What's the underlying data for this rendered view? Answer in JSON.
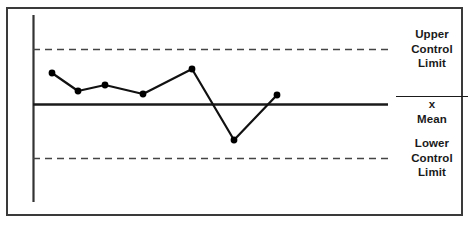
{
  "labels": {
    "ucl": {
      "line1": "Upper",
      "line2": "Control",
      "line3": "Limit"
    },
    "mean": {
      "symbol": "x",
      "text": " Mean"
    },
    "lcl": {
      "line1": "Lower",
      "line2": "Control",
      "line3": "Limit"
    }
  },
  "colors": {
    "frame": "#3a3a3a",
    "axis": "#333333",
    "mean_line": "#1a1a1a",
    "limit_line": "#444444",
    "series": "#111111",
    "marker": "#000000",
    "background": "#ffffff",
    "text": "#1a1a1a"
  },
  "chart_data": {
    "type": "line",
    "title": "",
    "subtitle": "",
    "xlabel": "",
    "ylabel": "",
    "grid": false,
    "legend_position": "right",
    "xlim": [
      0,
      8
    ],
    "ylim": [
      0,
      10
    ],
    "x": [
      1,
      2,
      3,
      4,
      5,
      6,
      7
    ],
    "series": [
      {
        "name": "Sample Measurement",
        "values": [
          6.7,
          5.4,
          5.9,
          5.2,
          7.4,
          2.2,
          5.1
        ],
        "marker": "circle"
      }
    ],
    "reference_lines": [
      {
        "name": "Upper Control Limit",
        "value": 8.8,
        "style": "dashed"
      },
      {
        "name": "x̄ Mean",
        "value": 5.0,
        "style": "solid"
      },
      {
        "name": "Lower Control Limit",
        "value": 1.2,
        "style": "dashed"
      }
    ],
    "annotations": [],
    "points_px": [
      [
        52,
        73
      ],
      [
        78,
        91
      ],
      [
        105,
        85
      ],
      [
        143,
        94
      ],
      [
        192,
        69
      ],
      [
        234,
        140
      ],
      [
        277,
        95
      ]
    ],
    "ucl_y_px": 49,
    "mean_y_px": 104,
    "lcl_y_px": 158,
    "axis_x_px": 33,
    "axis_top_px": 15,
    "axis_bottom_px": 202,
    "line_right_px": 388
  }
}
